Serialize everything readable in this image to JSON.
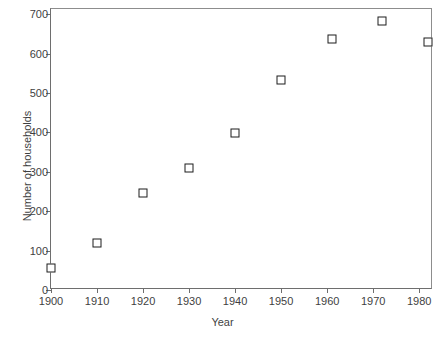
{
  "chart_data": {
    "type": "scatter",
    "title": "",
    "xlabel": "Year",
    "ylabel": "Number of households",
    "x": [
      1900,
      1910,
      1920,
      1930,
      1940,
      1950,
      1961,
      1972,
      1982
    ],
    "values": [
      55,
      120,
      245,
      310,
      398,
      533,
      637,
      683,
      628
    ],
    "xtick_labels": [
      "1900",
      "1910",
      "1920",
      "1930",
      "1940",
      "1950",
      "1960",
      "1970",
      "1980"
    ],
    "xticks": [
      1900,
      1910,
      1920,
      1930,
      1940,
      1950,
      1960,
      1970,
      1980
    ],
    "ytick_labels": [
      "0",
      "100",
      "200",
      "300",
      "400",
      "500",
      "600",
      "700"
    ],
    "yticks": [
      0,
      100,
      200,
      300,
      400,
      500,
      600,
      700
    ],
    "xlim": [
      1900,
      1983
    ],
    "ylim": [
      0,
      713
    ],
    "grid": false,
    "legend": false,
    "marker": "open-square",
    "marker_color": "#1d1d1d",
    "axis_color": "#6e6e6e",
    "background": "#ffffff"
  }
}
